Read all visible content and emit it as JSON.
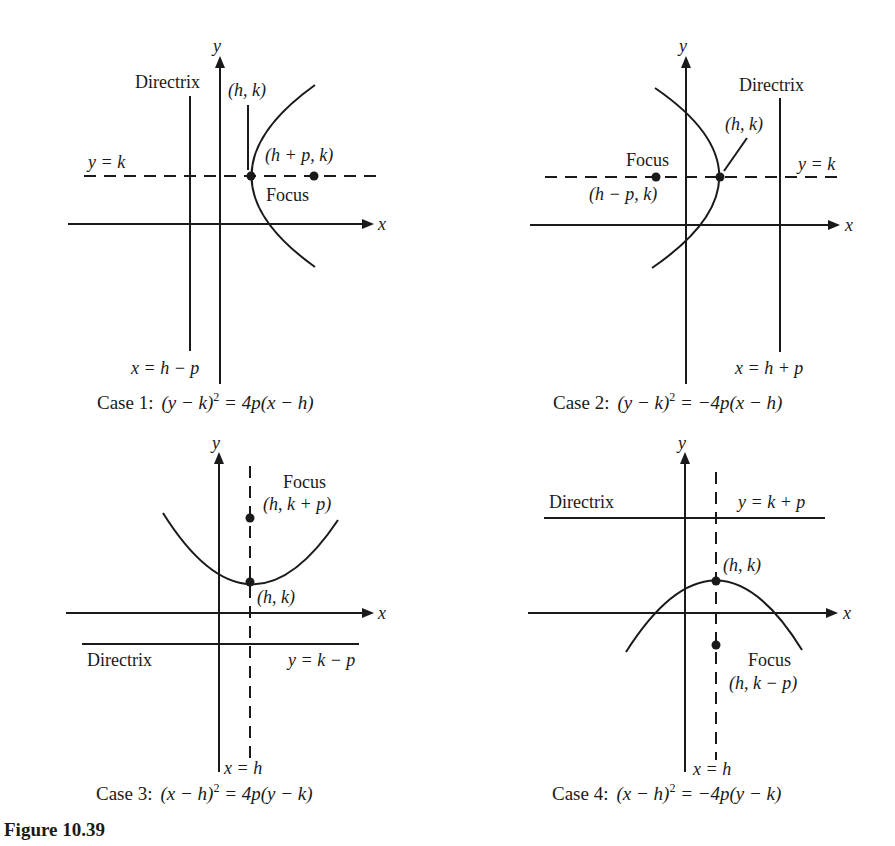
{
  "figure": {
    "label": "Figure 10.39"
  },
  "common": {
    "x_axis": "x",
    "y_axis": "y",
    "directrix": "Directrix",
    "focus": "Focus",
    "vertex": "(h, k)"
  },
  "cases": [
    {
      "name": "Case 1",
      "caption_prefix": "Case 1:",
      "equation_left": "(y − k)",
      "equation_exp": "2",
      "equation_right": " = 4p(x − h)",
      "directrix_eq": "x = h − p",
      "axis_eq": "y = k",
      "focus_coord": "(h + p, k)",
      "orientation": "opens right"
    },
    {
      "name": "Case 2",
      "caption_prefix": "Case 2:",
      "equation_left": "(y − k)",
      "equation_exp": "2",
      "equation_right": " = −4p(x − h)",
      "directrix_eq": "x = h + p",
      "axis_eq": "y = k",
      "focus_coord": "(h − p, k)",
      "orientation": "opens left"
    },
    {
      "name": "Case 3",
      "caption_prefix": "Case 3:",
      "equation_left": "(x − h)",
      "equation_exp": "2",
      "equation_right": " = 4p(y − k)",
      "directrix_eq": "y = k − p",
      "axis_eq": "x = h",
      "focus_coord": "(h, k + p)",
      "orientation": "opens up"
    },
    {
      "name": "Case 4",
      "caption_prefix": "Case 4:",
      "equation_left": "(x − h)",
      "equation_exp": "2",
      "equation_right": " = −4p(y − k)",
      "directrix_eq": "y = k + p",
      "axis_eq": "x = h",
      "focus_coord": "(h, k − p)",
      "orientation": "opens down"
    }
  ],
  "colors": {
    "ink": "#1a1a1a",
    "background": "#ffffff"
  }
}
